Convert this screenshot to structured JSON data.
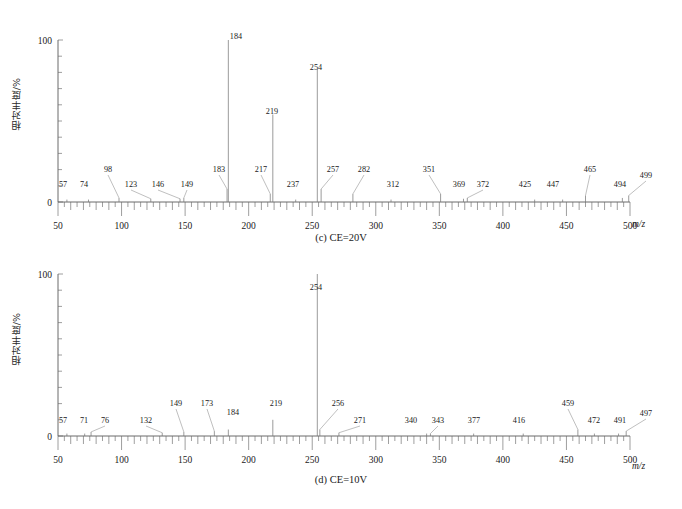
{
  "figure": {
    "ylabel": "相对丰度/%",
    "xlabel": "m/z",
    "y_ticks": [
      "0",
      "100"
    ],
    "x_ticks": [
      "50",
      "100",
      "150",
      "200",
      "250",
      "300",
      "350",
      "400",
      "450",
      "500"
    ],
    "axis_color": "#5a5a5a",
    "peak_color": "#7a7a7a",
    "background": "#ffffff"
  },
  "chart_data": [
    {
      "type": "bar",
      "id": "spectrum-c",
      "title": "(c) CE=20V",
      "xlabel": "m/z",
      "ylabel": "相对丰度/%",
      "xlim": [
        50,
        500
      ],
      "ylim": [
        0,
        100
      ],
      "grid": false,
      "legend": "none",
      "x": [
        57,
        74,
        98,
        123,
        146,
        149,
        183,
        184,
        217,
        219,
        237,
        254,
        257,
        282,
        312,
        351,
        369,
        372,
        425,
        447,
        465,
        494,
        499
      ],
      "values": [
        1.5,
        1.5,
        2.5,
        2,
        2,
        2.5,
        8,
        100,
        5,
        54,
        1.5,
        82,
        8,
        5,
        1.5,
        5,
        2,
        2.5,
        1.5,
        1.5,
        4,
        2.5,
        4
      ],
      "labels": [
        "57",
        "74",
        "98",
        "123",
        "146",
        "149",
        "183",
        "184",
        "217",
        "219",
        "237",
        "254",
        "257",
        "282",
        "312",
        "351",
        "369",
        "372",
        "425",
        "447",
        "465",
        "494",
        "499"
      ]
    },
    {
      "type": "bar",
      "id": "spectrum-d",
      "title": "(d) CE=10V",
      "xlabel": "m/z",
      "ylabel": "相对丰度/%",
      "xlim": [
        50,
        500
      ],
      "ylim": [
        0,
        100
      ],
      "grid": false,
      "legend": "none",
      "x": [
        57,
        71,
        76,
        132,
        149,
        173,
        184,
        219,
        254,
        256,
        271,
        340,
        343,
        377,
        416,
        459,
        472,
        491,
        497
      ],
      "values": [
        1.5,
        1.5,
        2.5,
        2,
        2.5,
        3,
        4,
        10,
        100,
        4,
        2,
        1.5,
        1.5,
        1.5,
        1.5,
        4,
        1.5,
        1.5,
        3
      ],
      "labels": [
        "57",
        "71",
        "76",
        "132",
        "149",
        "173",
        "184",
        "219",
        "254",
        "256",
        "271",
        "340",
        "343",
        "377",
        "416",
        "459",
        "472",
        "491",
        "497"
      ]
    }
  ],
  "panels": {
    "c": {
      "caption": "(c) CE=20V",
      "peaks": [
        {
          "mz": 57,
          "intensity": 1.5,
          "label": "57",
          "label_x": 63,
          "label_y": 187,
          "leader": false
        },
        {
          "mz": 74,
          "intensity": 1.5,
          "label": "74",
          "label_x": 84,
          "label_y": 187,
          "leader": false
        },
        {
          "mz": 98,
          "intensity": 2.5,
          "label": "98",
          "label_x": 108,
          "label_y": 172,
          "leader": true
        },
        {
          "mz": 123,
          "intensity": 2.0,
          "label": "123",
          "label_x": 131,
          "label_y": 187,
          "leader": true
        },
        {
          "mz": 146,
          "intensity": 2.0,
          "label": "146",
          "label_x": 158,
          "label_y": 187,
          "leader": true
        },
        {
          "mz": 149,
          "intensity": 2.5,
          "label": "149",
          "label_x": 187,
          "label_y": 187,
          "leader": true
        },
        {
          "mz": 183,
          "intensity": 8.0,
          "label": "183",
          "label_x": 219,
          "label_y": 172,
          "leader": true
        },
        {
          "mz": 184,
          "intensity": 100,
          "label": "184",
          "label_x": 236,
          "label_y": 39,
          "leader": false
        },
        {
          "mz": 217,
          "intensity": 5.0,
          "label": "217",
          "label_x": 261,
          "label_y": 172,
          "leader": true
        },
        {
          "mz": 219,
          "intensity": 54,
          "label": "219",
          "label_x": 272,
          "label_y": 114,
          "leader": false
        },
        {
          "mz": 237,
          "intensity": 1.5,
          "label": "237",
          "label_x": 293,
          "label_y": 187,
          "leader": false
        },
        {
          "mz": 254,
          "intensity": 82,
          "label": "254",
          "label_x": 316,
          "label_y": 70,
          "leader": false
        },
        {
          "mz": 257,
          "intensity": 8.0,
          "label": "257",
          "label_x": 333,
          "label_y": 172,
          "leader": true
        },
        {
          "mz": 282,
          "intensity": 5.0,
          "label": "282",
          "label_x": 364,
          "label_y": 172,
          "leader": true
        },
        {
          "mz": 312,
          "intensity": 1.5,
          "label": "312",
          "label_x": 393,
          "label_y": 187,
          "leader": false
        },
        {
          "mz": 351,
          "intensity": 5.0,
          "label": "351",
          "label_x": 429,
          "label_y": 172,
          "leader": true
        },
        {
          "mz": 369,
          "intensity": 2.0,
          "label": "369",
          "label_x": 459,
          "label_y": 187,
          "leader": false
        },
        {
          "mz": 372,
          "intensity": 2.5,
          "label": "372",
          "label_x": 483,
          "label_y": 187,
          "leader": true
        },
        {
          "mz": 425,
          "intensity": 1.5,
          "label": "425",
          "label_x": 525,
          "label_y": 187,
          "leader": false
        },
        {
          "mz": 447,
          "intensity": 1.5,
          "label": "447",
          "label_x": 553,
          "label_y": 187,
          "leader": false
        },
        {
          "mz": 465,
          "intensity": 4.0,
          "label": "465",
          "label_x": 590,
          "label_y": 172,
          "leader": true
        },
        {
          "mz": 494,
          "intensity": 2.5,
          "label": "494",
          "label_x": 620,
          "label_y": 187,
          "leader": false
        },
        {
          "mz": 499,
          "intensity": 4.0,
          "label": "499",
          "label_x": 646,
          "label_y": 178,
          "leader": true
        }
      ]
    },
    "d": {
      "caption": "(d) CE=10V",
      "peaks": [
        {
          "mz": 57,
          "intensity": 1.5,
          "label": "57",
          "label_x": 63,
          "label_y": 172,
          "leader": false
        },
        {
          "mz": 71,
          "intensity": 1.5,
          "label": "71",
          "label_x": 84,
          "label_y": 172,
          "leader": false
        },
        {
          "mz": 76,
          "intensity": 2.5,
          "label": "76",
          "label_x": 105,
          "label_y": 172,
          "leader": true
        },
        {
          "mz": 132,
          "intensity": 2.0,
          "label": "132",
          "label_x": 146,
          "label_y": 172,
          "leader": true
        },
        {
          "mz": 149,
          "intensity": 2.5,
          "label": "149",
          "label_x": 176,
          "label_y": 155,
          "leader": true
        },
        {
          "mz": 173,
          "intensity": 3.0,
          "label": "173",
          "label_x": 207,
          "label_y": 155,
          "leader": true
        },
        {
          "mz": 184,
          "intensity": 4.0,
          "label": "184",
          "label_x": 233,
          "label_y": 164,
          "leader": false
        },
        {
          "mz": 219,
          "intensity": 10,
          "label": "219",
          "label_x": 276,
          "label_y": 155,
          "leader": false
        },
        {
          "mz": 254,
          "intensity": 100,
          "label": "254",
          "label_x": 316,
          "label_y": 39,
          "leader": false
        },
        {
          "mz": 256,
          "intensity": 4.0,
          "label": "256",
          "label_x": 338,
          "label_y": 155,
          "leader": true
        },
        {
          "mz": 271,
          "intensity": 2.0,
          "label": "271",
          "label_x": 360,
          "label_y": 172,
          "leader": true
        },
        {
          "mz": 340,
          "intensity": 1.5,
          "label": "340",
          "label_x": 411,
          "label_y": 172,
          "leader": false
        },
        {
          "mz": 343,
          "intensity": 1.5,
          "label": "343",
          "label_x": 438,
          "label_y": 172,
          "leader": true
        },
        {
          "mz": 377,
          "intensity": 1.5,
          "label": "377",
          "label_x": 474,
          "label_y": 172,
          "leader": false
        },
        {
          "mz": 416,
          "intensity": 1.5,
          "label": "416",
          "label_x": 519,
          "label_y": 172,
          "leader": false
        },
        {
          "mz": 459,
          "intensity": 4.0,
          "label": "459",
          "label_x": 568,
          "label_y": 155,
          "leader": true
        },
        {
          "mz": 472,
          "intensity": 1.5,
          "label": "472",
          "label_x": 594,
          "label_y": 172,
          "leader": false
        },
        {
          "mz": 491,
          "intensity": 1.5,
          "label": "491",
          "label_x": 620,
          "label_y": 172,
          "leader": false
        },
        {
          "mz": 497,
          "intensity": 3.0,
          "label": "497",
          "label_x": 646,
          "label_y": 165,
          "leader": true
        }
      ]
    }
  }
}
